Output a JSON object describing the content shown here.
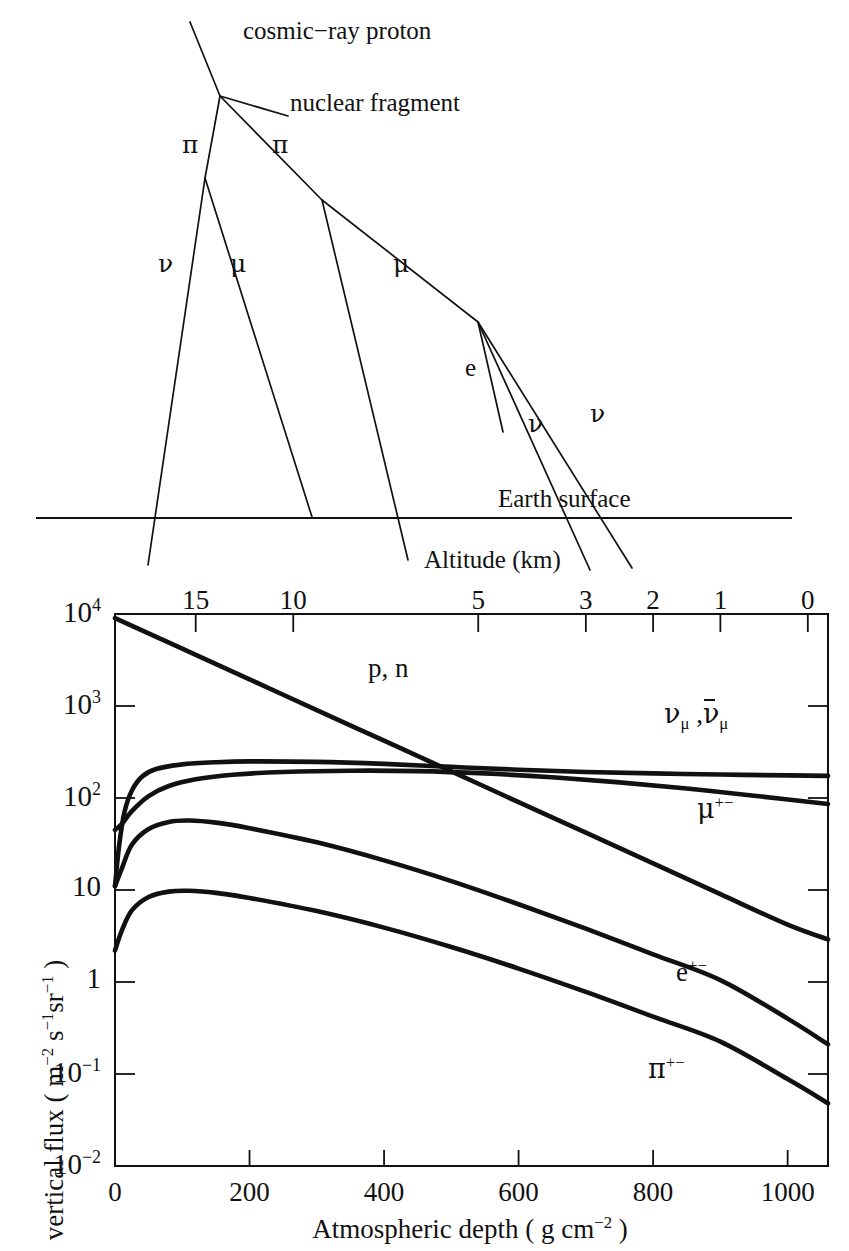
{
  "figure": {
    "title_upper": "Cosmic ray air shower cascade schematic",
    "upper_diagram": {
      "labels": {
        "primary": "cosmic−ray proton",
        "fragment": "nuclear fragment",
        "pion_left": "π",
        "pion_right": "π",
        "neutrino_left": "ν",
        "muon_left": "μ",
        "muon_right": "μ",
        "electron": "e",
        "neutrino_mid": "ν",
        "neutrino_right": "ν",
        "earth_surface": "Earth surface",
        "altitude_axis": "Altitude (km)"
      }
    }
  },
  "chart_data": {
    "type": "line",
    "title": "",
    "xlabel": "Atmospheric depth  ( g cm−2 )",
    "xlabel_parts": {
      "main": "Atmospheric depth  ( g cm",
      "exponent": "−2",
      "close": " )"
    },
    "ylabel": "vertical flux ( m−2 s−1sr−1 )",
    "ylabel_parts": {
      "lead": "vertical flux ( m",
      "e1": "−2",
      "mid1": " s",
      "e2": "−1",
      "mid2": "sr",
      "e3": "−1",
      "close": " )"
    },
    "x_axis": {
      "label": "Atmospheric depth ( g cm-2 )",
      "ticks": [
        0,
        200,
        400,
        600,
        800,
        1000
      ],
      "tick_labels": [
        "0",
        "200",
        "400",
        "600",
        "800",
        "1000"
      ],
      "range": [
        0,
        1060
      ],
      "scale": "linear"
    },
    "top_axis": {
      "label": "Altitude (km)",
      "ticks": [
        15,
        10,
        5,
        3,
        2,
        1,
        0
      ],
      "tick_labels": [
        "15",
        "10",
        "5",
        "3",
        "2",
        "1",
        "0"
      ],
      "tick_depths": [
        120,
        265,
        540,
        700,
        800,
        900,
        1030
      ],
      "scale": "nonlinear-altitude"
    },
    "y_axis": {
      "label": "vertical flux ( m-2 s-1 sr-1 )",
      "scale": "log",
      "range": [
        0.01,
        10000
      ],
      "ticks": [
        0.01,
        0.1,
        1,
        10,
        100,
        1000,
        10000
      ],
      "tick_labels": [
        "10−2",
        "10−1",
        "1",
        "10",
        "10²",
        "10³",
        "10⁴"
      ],
      "tick_label_parts": [
        {
          "base": "10",
          "exp": "−2"
        },
        {
          "base": "10",
          "exp": "−1"
        },
        {
          "base": "1",
          "exp": ""
        },
        {
          "base": "10",
          "exp": ""
        },
        {
          "base": "10",
          "exp": "2"
        },
        {
          "base": "10",
          "exp": "3"
        },
        {
          "base": "10",
          "exp": "4"
        }
      ]
    },
    "grid": false,
    "legend_position": "inline-labels",
    "series": [
      {
        "name": "p, n",
        "label": "p, n",
        "label_x": 420,
        "label_y": 3000,
        "points": [
          {
            "x": 0,
            "y": 9000
          },
          {
            "x": 100,
            "y": 4200
          },
          {
            "x": 200,
            "y": 1950
          },
          {
            "x": 300,
            "y": 900
          },
          {
            "x": 400,
            "y": 420
          },
          {
            "x": 500,
            "y": 195
          },
          {
            "x": 600,
            "y": 90
          },
          {
            "x": 700,
            "y": 42
          },
          {
            "x": 800,
            "y": 19.5
          },
          {
            "x": 900,
            "y": 9.0
          },
          {
            "x": 1000,
            "y": 4.2
          },
          {
            "x": 1060,
            "y": 2.9
          }
        ]
      },
      {
        "name": "nu_mu, anti-nu_mu",
        "label": "νμ , ν̄μ",
        "label_x": 820,
        "label_y": 430,
        "points": [
          {
            "x": 0,
            "y": 11
          },
          {
            "x": 6,
            "y": 30
          },
          {
            "x": 14,
            "y": 70
          },
          {
            "x": 25,
            "y": 120
          },
          {
            "x": 40,
            "y": 170
          },
          {
            "x": 60,
            "y": 205
          },
          {
            "x": 100,
            "y": 232
          },
          {
            "x": 150,
            "y": 245
          },
          {
            "x": 200,
            "y": 250
          },
          {
            "x": 300,
            "y": 247
          },
          {
            "x": 400,
            "y": 235
          },
          {
            "x": 500,
            "y": 218
          },
          {
            "x": 600,
            "y": 203
          },
          {
            "x": 700,
            "y": 192
          },
          {
            "x": 800,
            "y": 185
          },
          {
            "x": 900,
            "y": 180
          },
          {
            "x": 1000,
            "y": 176
          },
          {
            "x": 1060,
            "y": 174
          }
        ]
      },
      {
        "name": "mu+-",
        "label": "μ+−",
        "label_x": 830,
        "label_y": 55,
        "points": [
          {
            "x": 0,
            "y": 45
          },
          {
            "x": 10,
            "y": 52
          },
          {
            "x": 25,
            "y": 72
          },
          {
            "x": 50,
            "y": 105
          },
          {
            "x": 80,
            "y": 135
          },
          {
            "x": 120,
            "y": 160
          },
          {
            "x": 180,
            "y": 180
          },
          {
            "x": 250,
            "y": 192
          },
          {
            "x": 350,
            "y": 198
          },
          {
            "x": 450,
            "y": 196
          },
          {
            "x": 550,
            "y": 185
          },
          {
            "x": 650,
            "y": 168
          },
          {
            "x": 750,
            "y": 148
          },
          {
            "x": 850,
            "y": 127
          },
          {
            "x": 950,
            "y": 106
          },
          {
            "x": 1060,
            "y": 86
          }
        ]
      },
      {
        "name": "e+-",
        "label": "e+−",
        "label_x": 855,
        "label_y": 1.35,
        "points": [
          {
            "x": 0,
            "y": 11
          },
          {
            "x": 10,
            "y": 17
          },
          {
            "x": 25,
            "y": 31
          },
          {
            "x": 50,
            "y": 46
          },
          {
            "x": 80,
            "y": 55
          },
          {
            "x": 110,
            "y": 57
          },
          {
            "x": 150,
            "y": 54
          },
          {
            "x": 200,
            "y": 47
          },
          {
            "x": 300,
            "y": 33
          },
          {
            "x": 400,
            "y": 21
          },
          {
            "x": 500,
            "y": 12.5
          },
          {
            "x": 600,
            "y": 7.0
          },
          {
            "x": 700,
            "y": 3.8
          },
          {
            "x": 800,
            "y": 2.0
          },
          {
            "x": 900,
            "y": 1.05
          },
          {
            "x": 1000,
            "y": 0.4
          },
          {
            "x": 1060,
            "y": 0.21
          }
        ]
      },
      {
        "name": "pi+-",
        "label": "π+−",
        "label_x": 845,
        "label_y": 0.12,
        "points": [
          {
            "x": 0,
            "y": 2.2
          },
          {
            "x": 10,
            "y": 3.6
          },
          {
            "x": 25,
            "y": 6.0
          },
          {
            "x": 50,
            "y": 8.4
          },
          {
            "x": 80,
            "y": 9.6
          },
          {
            "x": 110,
            "y": 9.8
          },
          {
            "x": 150,
            "y": 9.3
          },
          {
            "x": 200,
            "y": 8.2
          },
          {
            "x": 300,
            "y": 5.9
          },
          {
            "x": 400,
            "y": 3.9
          },
          {
            "x": 500,
            "y": 2.4
          },
          {
            "x": 600,
            "y": 1.4
          },
          {
            "x": 700,
            "y": 0.78
          },
          {
            "x": 800,
            "y": 0.42
          },
          {
            "x": 900,
            "y": 0.225
          },
          {
            "x": 1000,
            "y": 0.088
          },
          {
            "x": 1060,
            "y": 0.048
          }
        ]
      }
    ]
  },
  "colors": {
    "ink": "#111111",
    "background": "#ffffff"
  }
}
